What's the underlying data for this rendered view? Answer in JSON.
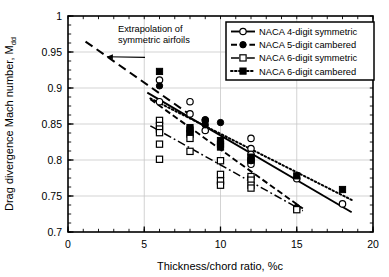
{
  "chart_data": {
    "type": "scatter",
    "title": "",
    "xlabel": "Thickness/chord ratio, %c",
    "ylabel": "Drag divergence Mach number, M",
    "ylabel_sub": "dd",
    "xlim": [
      0,
      20
    ],
    "ylim": [
      0.7,
      1
    ],
    "xticks": [
      0,
      5,
      10,
      15,
      20
    ],
    "yticks": [
      0.7,
      0.75,
      0.8,
      0.85,
      0.9,
      0.95,
      1
    ],
    "xtick_labels": [
      "0",
      "5",
      "10",
      "15",
      "20"
    ],
    "ytick_labels": [
      "0.7",
      "0.75",
      "0.8",
      "0.85",
      "0.9",
      "0.95",
      "1"
    ],
    "x_minor_step": 1,
    "y_minor_step": 0.0125,
    "grid": true,
    "grid_color": "#c8c8c8",
    "frame_color": "#000000",
    "legend_position": "top-right",
    "series": [
      {
        "name": "NACA 4-digit symmetric",
        "marker": "open-circle",
        "line_style": "solid",
        "color": "#000000",
        "points": [
          [
            6,
            0.911
          ],
          [
            6,
            0.881
          ],
          [
            8,
            0.881
          ],
          [
            8,
            0.864
          ],
          [
            9,
            0.855
          ],
          [
            9,
            0.841
          ],
          [
            12,
            0.83
          ],
          [
            12,
            0.816
          ],
          [
            12,
            0.808
          ],
          [
            12,
            0.798
          ],
          [
            12,
            0.794
          ],
          [
            12,
            0.776
          ],
          [
            15,
            0.774
          ],
          [
            15,
            0.733
          ],
          [
            18,
            0.739
          ]
        ],
        "fit_line": [
          [
            5.2,
            0.8935
          ],
          [
            18.6,
            0.7275
          ]
        ]
      },
      {
        "name": "NACA 5-digit cambered",
        "marker": "filled-circle",
        "line_style": "dashed",
        "color": "#000000",
        "points": [
          [
            6,
            0.903
          ],
          [
            8,
            0.845
          ],
          [
            8,
            0.84
          ],
          [
            9,
            0.856
          ],
          [
            9,
            0.849
          ],
          [
            10,
            0.852
          ],
          [
            12,
            0.802
          ],
          [
            12,
            0.799
          ],
          [
            15,
            0.734
          ]
        ],
        "fit_line": [
          [
            5.4,
            0.8845
          ],
          [
            15.4,
            0.7325
          ]
        ]
      },
      {
        "name": "NACA 6-digit symmetric",
        "marker": "open-square",
        "line_style": "dash-dot",
        "color": "#000000",
        "points": [
          [
            6,
            0.855
          ],
          [
            6,
            0.848
          ],
          [
            6,
            0.843
          ],
          [
            6,
            0.838
          ],
          [
            6,
            0.822
          ],
          [
            6,
            0.801
          ],
          [
            8,
            0.836
          ],
          [
            8,
            0.83
          ],
          [
            8,
            0.812
          ],
          [
            10,
            0.799
          ],
          [
            10,
            0.78
          ],
          [
            10,
            0.771
          ],
          [
            10,
            0.765
          ],
          [
            12,
            0.777
          ],
          [
            12,
            0.772
          ],
          [
            12,
            0.765
          ],
          [
            12,
            0.761
          ],
          [
            15,
            0.731
          ]
        ],
        "fit_line": [
          [
            5.4,
            0.8475
          ],
          [
            15.4,
            0.7295
          ]
        ]
      },
      {
        "name": "NACA 6-digit cambered",
        "marker": "filled-square",
        "line_style": "dotted",
        "color": "#000000",
        "points": [
          [
            6,
            0.923
          ],
          [
            8,
            0.845
          ],
          [
            8,
            0.839
          ],
          [
            10,
            0.827
          ],
          [
            10,
            0.822
          ],
          [
            10,
            0.818
          ],
          [
            12,
            0.804
          ],
          [
            12,
            0.8
          ],
          [
            15,
            0.778
          ],
          [
            18,
            0.759
          ]
        ],
        "fit_line": [
          [
            5.4,
            0.8855
          ],
          [
            18.6,
            0.7445
          ]
        ]
      }
    ],
    "extrapolation": {
      "label_line1": "Extrapolation of",
      "label_line2": "symmetric airfoils",
      "line_style": "long-dash",
      "from": [
        1.15,
        0.9645
      ],
      "to": [
        7.9,
        0.8645
      ],
      "arrow_from": [
        5.05,
        0.9425
      ],
      "arrow_to": [
        2.55,
        0.9435
      ]
    }
  }
}
